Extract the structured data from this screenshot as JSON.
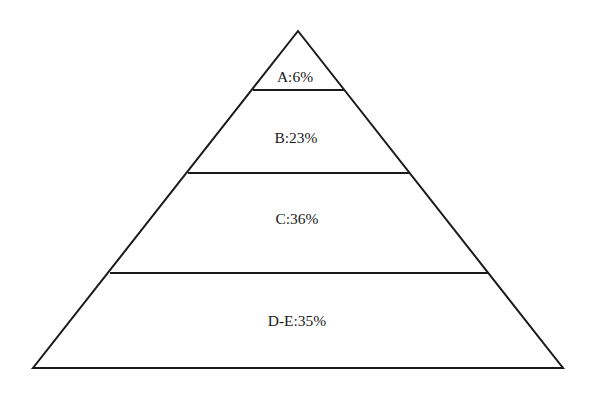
{
  "diagram": {
    "type": "pyramid",
    "colors": {
      "line": "#1a1a1a",
      "background": "#ffffff",
      "text": "#1a1a1a"
    },
    "tiers": [
      {
        "id": "A",
        "label": "A:6%",
        "value_percent": 6
      },
      {
        "id": "B",
        "label": "B:23%",
        "value_percent": 23
      },
      {
        "id": "C",
        "label": "C:36%",
        "value_percent": 36
      },
      {
        "id": "D-E",
        "label": "D-E:35%",
        "value_percent": 35
      }
    ]
  }
}
